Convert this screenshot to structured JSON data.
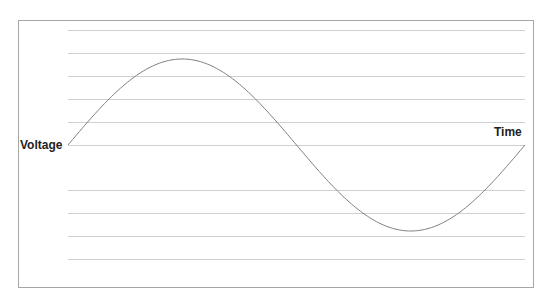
{
  "chart_data": {
    "type": "line",
    "title": "",
    "xlabel": "Time",
    "ylabel": "Voltage",
    "x": [
      0,
      45,
      90,
      135,
      180,
      225,
      270,
      315,
      360
    ],
    "series": [
      {
        "name": "Voltage",
        "values": [
          0,
          0.707,
          1,
          0.707,
          0,
          -0.707,
          -1,
          -0.707,
          0
        ]
      }
    ],
    "ylim": [
      -1.25,
      1.25
    ],
    "grid": true,
    "legend": "none",
    "colors": {
      "curve": "#7f7f7f",
      "grid": "#d0d0d0",
      "frame": "#a6a6a6",
      "text": "#222222"
    }
  },
  "labels": {
    "y_axis": "Voltage",
    "x_axis": "Time"
  }
}
